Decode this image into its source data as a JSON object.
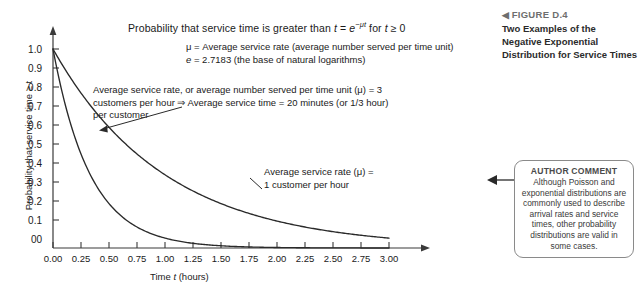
{
  "chart_data": {
    "type": "line",
    "title_parts": {
      "lead": "Probability that service time is greater than ",
      "var_t": "t",
      "equals": " = ",
      "base": "e",
      "exponent": "−μt",
      "tail": " for ",
      "var_t2": "t",
      "cond": " ≥ 0"
    },
    "xlabel_parts": {
      "lead": "Time ",
      "var": "t",
      "tail": " (hours)"
    },
    "xlabel": "Time t (hours)",
    "ylabel": "Probability that service time ≥ t",
    "xlim": [
      0,
      3
    ],
    "ylim": [
      0,
      1
    ],
    "grid": false,
    "xticks": [
      "0.00",
      "0.25",
      "0.50",
      "0.75",
      "1.00",
      "1.25",
      "1.50",
      "1.75",
      "2.00",
      "2.25",
      "2.50",
      "2.75",
      "3.00"
    ],
    "xtick_values": [
      0,
      0.25,
      0.5,
      0.75,
      1.0,
      1.25,
      1.5,
      1.75,
      2.0,
      2.25,
      2.5,
      2.75,
      3.0
    ],
    "yticks": [
      "00",
      "0.1",
      "0.2",
      "0.3",
      "0.4",
      "0.5",
      "0.6",
      "0.7",
      "0.8",
      "0.9",
      "1.0"
    ],
    "ytick_values": [
      0,
      0.1,
      0.2,
      0.3,
      0.4,
      0.5,
      0.6,
      0.7,
      0.8,
      0.9,
      1.0
    ],
    "series": [
      {
        "name": "Average service rate (μ) = 1 customer per hour",
        "mu": 1,
        "x": [
          0,
          0.25,
          0.5,
          0.75,
          1.0,
          1.25,
          1.5,
          1.75,
          2.0,
          2.25,
          2.5,
          2.75,
          3.0
        ],
        "values": [
          1.0,
          0.779,
          0.607,
          0.472,
          0.368,
          0.287,
          0.223,
          0.174,
          0.135,
          0.105,
          0.082,
          0.064,
          0.05
        ]
      },
      {
        "name": "Average service rate (μ) = 3 customers per hour",
        "mu": 3,
        "x": [
          0,
          0.25,
          0.5,
          0.75,
          1.0,
          1.25,
          1.5,
          1.75,
          2.0,
          2.25,
          2.5,
          2.75,
          3.0
        ],
        "values": [
          1.0,
          0.472,
          0.223,
          0.105,
          0.05,
          0.024,
          0.011,
          0.005,
          0.0025,
          0.0012,
          0.0006,
          0.0003,
          0.0001
        ]
      }
    ],
    "legend": {
      "line1_sym": "μ",
      "line1": " = Average service rate (average number served per time unit)",
      "line2_sym": "e",
      "line2": " = 2.7183 (the base of natural logarithms)"
    },
    "annotations": [
      {
        "name": "mu3-annotation",
        "line1": "Average service rate, or average number served per time unit (μ) = 3",
        "line2": "customers per hour ⇒ Average service time = 20 minutes (or 1/3 hour)",
        "line3": "per customer"
      },
      {
        "name": "mu1-annotation",
        "line1": "Average service rate (μ) =",
        "line2": "1 customer per hour"
      }
    ]
  },
  "sidebar": {
    "figure": {
      "arrow": "◀",
      "label": "FIGURE D.4",
      "caption": "Two Examples of the Negative Exponential Distribution for Service Times"
    },
    "author_comment": {
      "title": "AUTHOR COMMENT",
      "text": "Although Poisson and exponential distributions are commonly used to describe arrival rates and service times, other probability distributions are valid in some cases."
    }
  }
}
